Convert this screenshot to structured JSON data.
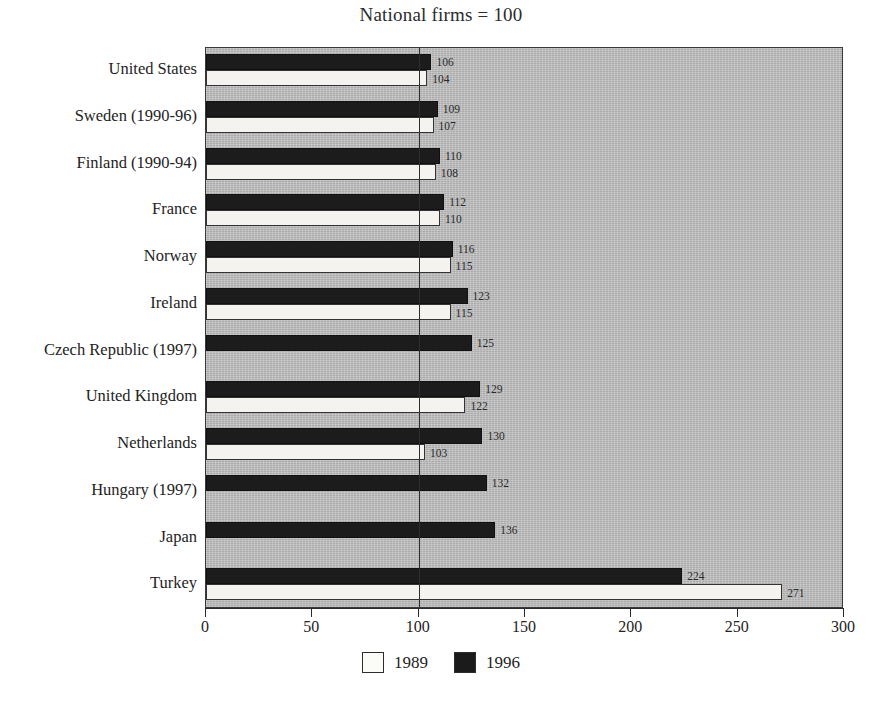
{
  "title": "National firms = 100",
  "chart_data": {
    "type": "bar",
    "orientation": "horizontal",
    "title": "National firms = 100",
    "xlabel": "",
    "ylabel": "",
    "xlim": [
      0,
      300
    ],
    "xticks": [
      0,
      50,
      100,
      150,
      200,
      250,
      300
    ],
    "xtick_labels": [
      "0",
      "50",
      "100",
      "150",
      "200",
      "250",
      "300"
    ],
    "grid": false,
    "reference_line": 100,
    "legend_position": "bottom",
    "categories": [
      "United States",
      "Sweden (1990-96)",
      "Finland (1990-94)",
      "France",
      "Norway",
      "Ireland",
      "Czech Republic (1997)",
      "United Kingdom",
      "Netherlands",
      "Hungary (1997)",
      "Japan",
      "Turkey"
    ],
    "series": [
      {
        "name": "1996",
        "color": "#1c1c1c",
        "values": [
          106,
          109,
          110,
          112,
          116,
          123,
          125,
          129,
          130,
          132,
          136,
          224
        ],
        "labels": [
          "106",
          "109",
          "110",
          "112",
          "116",
          "123",
          "125",
          "129",
          "130",
          "132",
          "136",
          "224"
        ]
      },
      {
        "name": "1989",
        "color": "#f4f3ef",
        "values": [
          104,
          107,
          108,
          110,
          115,
          115,
          null,
          122,
          103,
          null,
          null,
          271
        ],
        "labels": [
          "104",
          "107",
          "108",
          "110",
          "115",
          "115",
          "",
          "122",
          "103",
          "",
          "",
          "271"
        ]
      }
    ]
  },
  "legend": [
    {
      "label": "1989",
      "swatch": "white-square"
    },
    {
      "label": "1996",
      "swatch": "black-square"
    }
  ]
}
